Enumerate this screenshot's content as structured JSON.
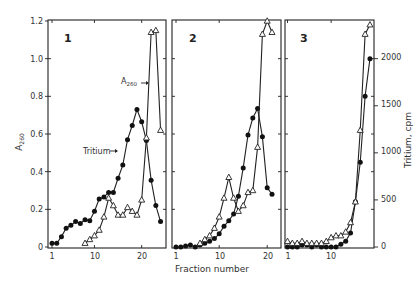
{
  "chart_data": {
    "type": "line",
    "title": "",
    "xlabel": "Fraction number",
    "ylabel_left": "A260",
    "ylabel_right": "Tritium, cpm",
    "ylim_left": [
      0,
      1.2
    ],
    "ylim_right": [
      0,
      2400
    ],
    "left_ticks": [
      "0",
      "0.2",
      "0.4",
      "0.6",
      "0.8",
      "1.0",
      "1.2"
    ],
    "right_ticks": [
      "0",
      "500",
      "1000",
      "1500",
      "2000"
    ],
    "grid": false,
    "legend": "inline annotations in panel 1",
    "annotations": [
      {
        "text": "A260",
        "panel": 1,
        "points_to": "A260 (open triangles)"
      },
      {
        "text": "Tritium",
        "panel": 1,
        "points_to": "Tritium (filled circles)"
      }
    ],
    "panels": [
      {
        "label": "1",
        "x_ticks": [
          "1",
          "10",
          "20"
        ],
        "series": [
          {
            "name": "Tritium",
            "marker": "filled-circle",
            "axis": "right",
            "x": [
              1,
              2,
              3,
              4,
              5,
              6,
              7,
              8,
              9,
              10,
              11,
              12,
              13,
              14,
              15,
              16,
              17,
              18,
              19,
              20,
              21,
              22,
              23,
              24
            ],
            "values": [
              40,
              40,
              110,
              200,
              230,
              270,
              250,
              290,
              280,
              380,
              510,
              530,
              580,
              580,
              730,
              870,
              1140,
              1290,
              1460,
              1330,
              1130,
              710,
              440,
              270
            ]
          },
          {
            "name": "A260",
            "marker": "open-triangle",
            "axis": "left",
            "x": [
              8,
              9,
              10,
              11,
              12,
              13,
              14,
              15,
              16,
              17,
              18,
              19,
              20,
              21,
              22,
              23,
              24
            ],
            "values": [
              0.02,
              0.04,
              0.06,
              0.09,
              0.16,
              0.26,
              0.22,
              0.17,
              0.17,
              0.21,
              0.19,
              0.17,
              0.25,
              0.58,
              1.14,
              1.15,
              0.62
            ]
          }
        ]
      },
      {
        "label": "2",
        "x_ticks": [
          "1",
          "10",
          "20"
        ],
        "series": [
          {
            "name": "Tritium",
            "marker": "filled-circle",
            "axis": "right",
            "x": [
              1,
              2,
              3,
              4,
              5,
              6,
              7,
              8,
              9,
              10,
              11,
              12,
              13,
              14,
              15,
              16,
              17,
              18,
              19,
              20,
              21
            ],
            "values": [
              0,
              0,
              10,
              20,
              0,
              20,
              40,
              60,
              90,
              140,
              220,
              280,
              350,
              540,
              840,
              1190,
              1370,
              1470,
              1170,
              630,
              560
            ]
          },
          {
            "name": "A260",
            "marker": "open-triangle",
            "axis": "left",
            "x": [
              6,
              7,
              8,
              9,
              10,
              11,
              12,
              13,
              14,
              15,
              16,
              17,
              18,
              19,
              20,
              21
            ],
            "values": [
              0.02,
              0.04,
              0.06,
              0.1,
              0.16,
              0.26,
              0.37,
              0.26,
              0.19,
              0.22,
              0.29,
              0.3,
              0.53,
              1.13,
              1.2,
              1.14
            ]
          }
        ]
      },
      {
        "label": "3",
        "x_ticks": [
          "1",
          "10"
        ],
        "series": [
          {
            "name": "Tritium",
            "marker": "filled-circle",
            "axis": "right",
            "x": [
              1,
              2,
              3,
              4,
              5,
              6,
              7,
              8,
              9,
              10,
              11,
              12,
              13,
              14,
              15,
              16,
              17,
              18
            ],
            "values": [
              0,
              0,
              0,
              20,
              20,
              0,
              20,
              0,
              0,
              0,
              0,
              30,
              60,
              150,
              480,
              900,
              1600,
              2000
            ]
          },
          {
            "name": "A260",
            "marker": "open-triangle",
            "axis": "left",
            "x": [
              1,
              2,
              3,
              4,
              5,
              6,
              7,
              8,
              9,
              10,
              11,
              12,
              13,
              14,
              15,
              16,
              17,
              18
            ],
            "values": [
              0.03,
              0.02,
              0.02,
              0.03,
              0.02,
              0.02,
              0.02,
              0.02,
              0.03,
              0.05,
              0.06,
              0.06,
              0.08,
              0.13,
              0.24,
              0.62,
              1.13,
              1.18,
              0.66
            ]
          }
        ]
      }
    ]
  },
  "labels": {
    "ylabel_left": "A",
    "ylabel_left_sub": "260",
    "ylabel_right": "Tritium, cpm",
    "xlabel": "Fraction number",
    "annot_a260": "A",
    "annot_a260_sub": "260",
    "annot_tritium": "Tritium",
    "panel1": "1",
    "panel2": "2",
    "panel3": "3",
    "left_ticks": [
      "0",
      "0.2",
      "0.4",
      "0.6",
      "0.8",
      "1.0",
      "1.2"
    ],
    "right_ticks": [
      "0",
      "500",
      "1000",
      "1500",
      "2000"
    ],
    "x1_ticks": [
      "1",
      "10",
      "20"
    ],
    "x2_ticks": [
      "1",
      "10",
      "20"
    ],
    "x3_ticks": [
      "1",
      "10"
    ]
  }
}
